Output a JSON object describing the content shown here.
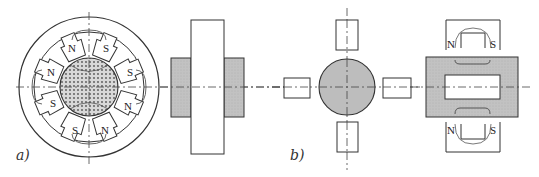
{
  "figure": {
    "panels": [
      {
        "id": "a",
        "label": "a)",
        "description": "Permanent-magnet stepper motor cross-section with 8-pole stator and hatched rotor, plus side view",
        "stator_poles": [
          {
            "label": "N"
          },
          {
            "label": "S"
          },
          {
            "label": "S"
          },
          {
            "label": "N"
          },
          {
            "label": "N"
          },
          {
            "label": "S"
          },
          {
            "label": "S"
          },
          {
            "label": "N"
          }
        ]
      },
      {
        "id": "b",
        "label": "b)",
        "description": "Rotor with four magnets around it, plus side view with two U-shaped magnets",
        "magnets": [
          {
            "position": "top",
            "left_label": "N",
            "right_label": "S"
          },
          {
            "position": "bottom",
            "left_label": "N",
            "right_label": "S"
          }
        ]
      }
    ],
    "colors": {
      "line": "#333333",
      "rotor_fill": "#bdbdbd",
      "side_fill": "#c4c4c4",
      "background": "#ffffff"
    }
  }
}
